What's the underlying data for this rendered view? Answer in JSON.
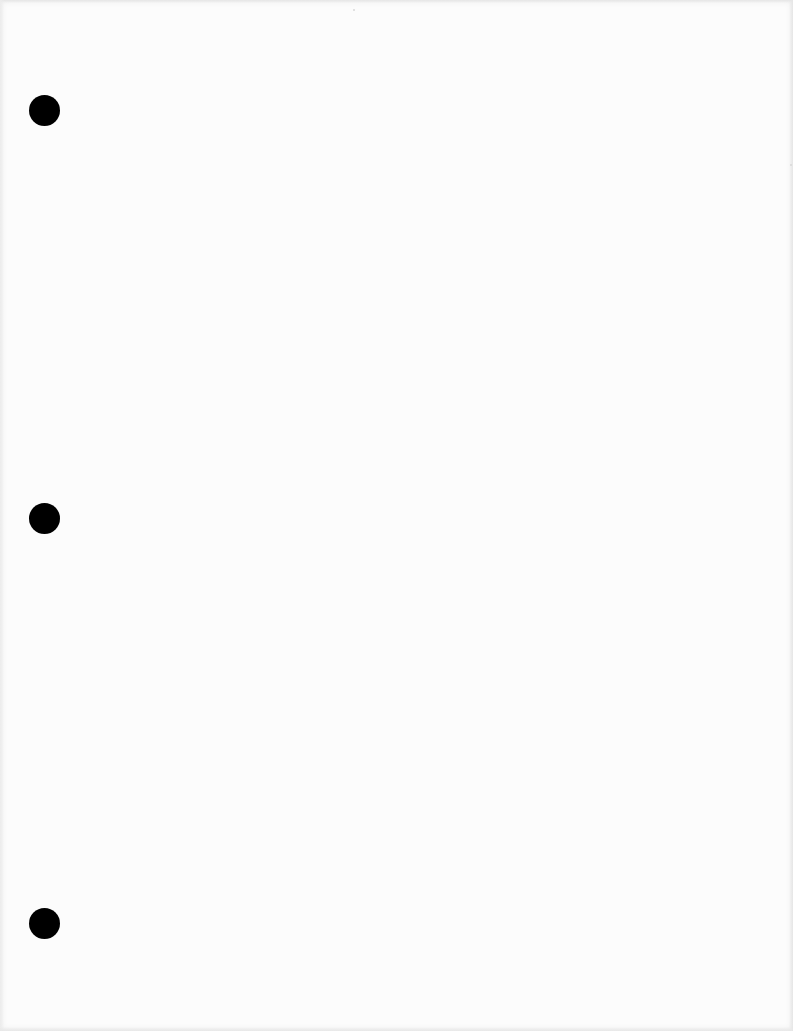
{
  "document": {
    "type": "blank-three-hole-punched-page",
    "paper_color": "#fcfcfc",
    "hole_color": "#000000",
    "punch_holes": [
      {
        "cx": 44,
        "cy": 110,
        "diameter": 31
      },
      {
        "cx": 44,
        "cy": 518,
        "diameter": 31
      },
      {
        "cx": 44,
        "cy": 923,
        "diameter": 31
      }
    ]
  }
}
